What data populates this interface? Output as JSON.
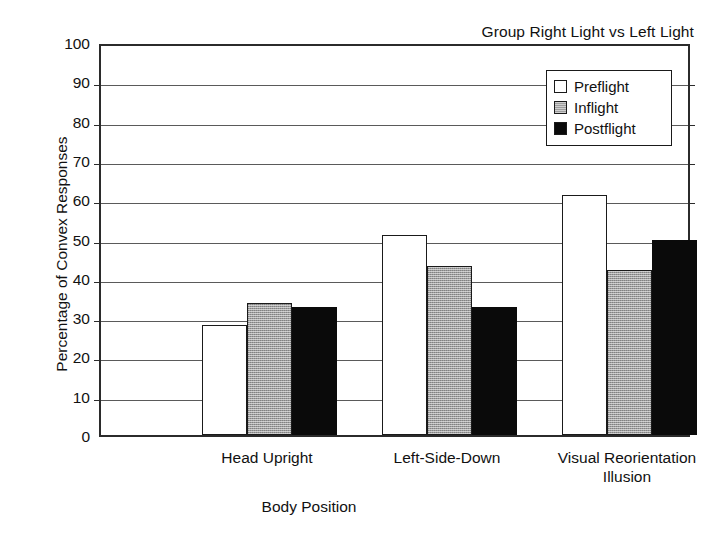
{
  "chart_data": {
    "type": "bar",
    "title": "Group Right Light vs Left Light",
    "xlabel": "Body Position",
    "ylabel": "Percentage of Convex Responses",
    "categories": [
      "Head Upright",
      "Left-Side-Down",
      "Visual Reorientation Illusion"
    ],
    "category_lines": [
      [
        "Head Upright"
      ],
      [
        "Left-Side-Down"
      ],
      [
        "Visual Reorientation",
        "Illusion"
      ]
    ],
    "series": [
      {
        "name": "Preflight",
        "color": "#ffffff",
        "values": [
          28,
          51,
          61
        ]
      },
      {
        "name": "Inflight",
        "color": "#9d9d9d",
        "values": [
          33.5,
          43,
          42
        ]
      },
      {
        "name": "Postflight",
        "color": "#0a0a0a",
        "values": [
          32.5,
          32.5,
          49.5
        ]
      }
    ],
    "ylim": [
      0,
      100
    ],
    "yticks": [
      0,
      10,
      20,
      30,
      40,
      50,
      60,
      70,
      80,
      90,
      100
    ],
    "ytick_labels": [
      "0",
      "10",
      "20",
      "30",
      "40",
      "50",
      "60",
      "70",
      "80",
      "90",
      "100"
    ],
    "grid": true,
    "legend_position": "upper right",
    "legend_entries": [
      "Preflight",
      "Inflight",
      "Postflight"
    ]
  }
}
